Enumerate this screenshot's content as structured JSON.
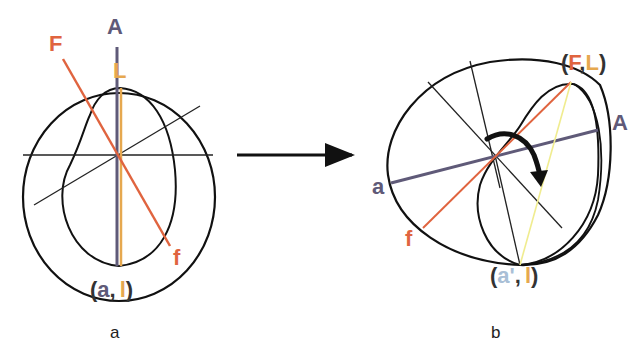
{
  "colors": {
    "outline": "#111111",
    "axis_A": "#5f5a78",
    "axis_F": "#e0643f",
    "axis_L": "#e6a84f",
    "axis_l_light": "#f3f19a",
    "a_prime": "#a9bfd6"
  },
  "panel_a": {
    "caption": "a",
    "label_A": "A",
    "label_F": "F",
    "label_L": "L",
    "label_f": "f",
    "bottom_open": "(",
    "bottom_a": "a",
    "bottom_comma": ",",
    "bottom_l": "l",
    "bottom_close": ")"
  },
  "panel_b": {
    "caption": "b",
    "top_open": "(",
    "top_F": "F",
    "top_comma": ",",
    "top_L": "L",
    "top_close": ")",
    "label_A": "A",
    "label_a": "a",
    "label_f": "f",
    "bottom_open": "(",
    "bottom_a_prime": "a'",
    "bottom_comma": ",",
    "bottom_l": "l",
    "bottom_close": ")"
  },
  "transition_arrow": "right-arrow",
  "rotation_arrow": "curved-arrow"
}
